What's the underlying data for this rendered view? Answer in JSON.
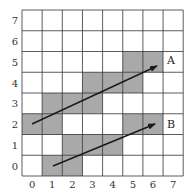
{
  "grid": {
    "cols": 8,
    "rows": 8,
    "origin_x": 22,
    "origin_y": 10,
    "cell_w": 20.15,
    "cell_h": 20.75,
    "line_color": "#333333",
    "fill_color": "#a9a9a9",
    "x_labels": [
      "0",
      "1",
      "2",
      "3",
      "4",
      "5",
      "6",
      "7"
    ],
    "y_labels": [
      "0",
      "1",
      "2",
      "3",
      "4",
      "5",
      "6",
      "7"
    ],
    "shaded_cells": [
      {
        "col": 5,
        "row": 5
      },
      {
        "col": 6,
        "row": 5
      },
      {
        "col": 3,
        "row": 4
      },
      {
        "col": 4,
        "row": 4
      },
      {
        "col": 5,
        "row": 4
      },
      {
        "col": 1,
        "row": 3
      },
      {
        "col": 2,
        "row": 3
      },
      {
        "col": 3,
        "row": 3
      },
      {
        "col": 0,
        "row": 2
      },
      {
        "col": 1,
        "row": 2
      },
      {
        "col": 5,
        "row": 2
      },
      {
        "col": 6,
        "row": 2
      },
      {
        "col": 2,
        "row": 1
      },
      {
        "col": 3,
        "row": 1
      },
      {
        "col": 4,
        "row": 1
      },
      {
        "col": 1,
        "row": 0
      },
      {
        "col": 2,
        "row": 0
      }
    ]
  },
  "arrows": [
    {
      "name": "A",
      "label": "A",
      "from": [
        0,
        2
      ],
      "to": [
        6,
        5
      ],
      "x1": 32,
      "y1": 124,
      "x2": 157,
      "y2": 66,
      "label_x": 167,
      "label_y": 64
    },
    {
      "name": "B",
      "label": "B",
      "from": [
        1,
        0
      ],
      "to": [
        6,
        2
      ],
      "x1": 53,
      "y1": 166,
      "x2": 155,
      "y2": 124,
      "label_x": 167,
      "label_y": 128
    }
  ],
  "arrow_color": "#1a1a1a"
}
